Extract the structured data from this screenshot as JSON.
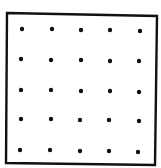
{
  "diagram": {
    "type": "dot-grid",
    "rows": 5,
    "cols": 5,
    "frame": {
      "corners": [
        [
          7,
          13
        ],
        [
          157,
          16
        ],
        [
          155,
          165
        ],
        [
          6,
          163
        ]
      ],
      "stroke": "#111111",
      "stroke_width": 2.4
    },
    "dot_color": "#111111",
    "dot_radius": 2.2,
    "dots": [
      [
        [
          22,
          29
        ],
        [
          52,
          29
        ],
        [
          81,
          30
        ],
        [
          110,
          30
        ],
        [
          140,
          31
        ]
      ],
      [
        [
          21,
          59
        ],
        [
          51,
          60
        ],
        [
          81,
          60
        ],
        [
          110,
          61
        ],
        [
          139,
          61
        ]
      ],
      [
        [
          21,
          90
        ],
        [
          51,
          90
        ],
        [
          81,
          91
        ],
        [
          110,
          91
        ],
        [
          139,
          92
        ]
      ],
      [
        [
          21,
          119
        ],
        [
          51,
          119
        ],
        [
          80,
          120
        ],
        [
          109,
          120
        ],
        [
          139,
          121
        ]
      ],
      [
        [
          20,
          150
        ],
        [
          50,
          150
        ],
        [
          80,
          151
        ],
        [
          109,
          151
        ],
        [
          138,
          152
        ]
      ]
    ]
  }
}
